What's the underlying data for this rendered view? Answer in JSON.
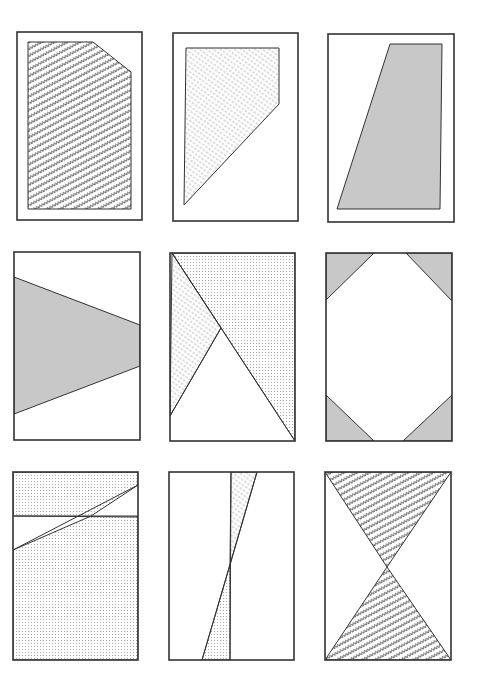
{
  "canvas": {
    "width": 479,
    "height": 689,
    "background": "#ffffff"
  },
  "colors": {
    "stroke": "#333333",
    "solid_gray": "#c8c8c8",
    "zigzag_ink": "#444444",
    "dot_ink": "#9a9a9a",
    "hatch_ink": "#8a8a8a"
  },
  "panels": [
    {
      "id": "panel-1",
      "frame": [
        17,
        32,
        125,
        188
      ],
      "shapes": [
        {
          "name": "pentagon-zigzag",
          "fill": "zigzag",
          "points": [
            [
              28,
              42
            ],
            [
              93,
              42
            ],
            [
              131,
              72
            ],
            [
              131,
              209
            ],
            [
              28,
              209
            ]
          ]
        }
      ]
    },
    {
      "id": "panel-2",
      "frame": [
        173,
        33,
        125,
        188
      ],
      "shapes": [
        {
          "name": "quad-hatched",
          "fill": "hatch",
          "points": [
            [
              186,
              48
            ],
            [
              279,
              48
            ],
            [
              279,
              104
            ],
            [
              184,
              205
            ]
          ]
        }
      ]
    },
    {
      "id": "panel-3",
      "frame": [
        328,
        34,
        126,
        188
      ],
      "shapes": [
        {
          "name": "trapezoid-gray",
          "fill": "solid",
          "points": [
            [
              390,
              44
            ],
            [
              442,
              44
            ],
            [
              440,
              209
            ],
            [
              337,
              209
            ]
          ]
        }
      ]
    },
    {
      "id": "panel-4",
      "frame": [
        14,
        252,
        126,
        188
      ],
      "shapes": [
        {
          "name": "wedge-gray",
          "fill": "solid",
          "points": [
            [
              14,
              277
            ],
            [
              140,
              325
            ],
            [
              140,
              366
            ],
            [
              14,
              414
            ]
          ]
        }
      ]
    },
    {
      "id": "panel-5",
      "frame": [
        170,
        253,
        125,
        188
      ],
      "shapes": [
        {
          "name": "region-dotted",
          "fill": "dots",
          "points": [
            [
              172,
              253
            ],
            [
              295,
              253
            ],
            [
              295,
              441
            ]
          ]
        },
        {
          "name": "region-hatched",
          "fill": "hatch",
          "points": [
            [
              172,
              253
            ],
            [
              221,
              328
            ],
            [
              170,
              416
            ]
          ]
        }
      ],
      "lines": [
        [
          [
            172,
            253
          ],
          [
            295,
            441
          ]
        ],
        [
          [
            221,
            328
          ],
          [
            170,
            416
          ]
        ]
      ]
    },
    {
      "id": "panel-6",
      "frame": [
        326,
        253,
        126,
        188
      ],
      "shapes": [
        {
          "name": "corner-tl",
          "fill": "solid",
          "points": [
            [
              326,
              253
            ],
            [
              374,
              253
            ],
            [
              326,
              300
            ]
          ]
        },
        {
          "name": "corner-tr",
          "fill": "solid",
          "points": [
            [
              406,
              253
            ],
            [
              452,
              253
            ],
            [
              452,
              301
            ]
          ]
        },
        {
          "name": "corner-bl",
          "fill": "solid",
          "points": [
            [
              326,
              395
            ],
            [
              374,
              441
            ],
            [
              326,
              441
            ]
          ]
        },
        {
          "name": "corner-br",
          "fill": "solid",
          "points": [
            [
              452,
              395
            ],
            [
              452,
              441
            ],
            [
              403,
              441
            ]
          ]
        }
      ]
    },
    {
      "id": "panel-7",
      "frame": [
        13,
        472,
        125,
        188
      ],
      "shapes": [
        {
          "name": "band-top-dotted",
          "fill": "dots",
          "points": [
            [
              13,
              472
            ],
            [
              138,
              472
            ],
            [
              138,
              485
            ],
            [
              91,
              516
            ],
            [
              13,
              516
            ]
          ]
        },
        {
          "name": "band-bottom-dotted",
          "fill": "dots",
          "points": [
            [
              13,
              550
            ],
            [
              91,
              516
            ],
            [
              138,
              516
            ],
            [
              138,
              660
            ],
            [
              13,
              660
            ]
          ]
        }
      ],
      "lines": [
        [
          [
            13,
            516
          ],
          [
            138,
            517
          ]
        ],
        [
          [
            13,
            550
          ],
          [
            138,
            485
          ]
        ]
      ]
    },
    {
      "id": "panel-8",
      "frame": [
        169,
        472,
        125,
        188
      ],
      "shapes": [
        {
          "name": "sliver-top-hatched",
          "fill": "hatch",
          "points": [
            [
              231,
              472
            ],
            [
              257,
              472
            ],
            [
              230,
              565
            ]
          ]
        },
        {
          "name": "sliver-bottom-dotted",
          "fill": "dots",
          "points": [
            [
              230,
              565
            ],
            [
              230,
              660
            ],
            [
              202,
              660
            ]
          ]
        }
      ],
      "lines": [
        [
          [
            231,
            472
          ],
          [
            230,
            660
          ]
        ],
        [
          [
            257,
            472
          ],
          [
            202,
            660
          ]
        ]
      ]
    },
    {
      "id": "panel-9",
      "frame": [
        325,
        472,
        126,
        188
      ],
      "shapes": [
        {
          "name": "hourglass-top-zigzag",
          "fill": "zigzag",
          "points": [
            [
              325,
              472
            ],
            [
              451,
              472
            ],
            [
              387,
              567
            ]
          ]
        },
        {
          "name": "hourglass-bottom-zigzag",
          "fill": "zigzag",
          "points": [
            [
              387,
              567
            ],
            [
              451,
              660
            ],
            [
              325,
              660
            ]
          ]
        }
      ]
    }
  ]
}
